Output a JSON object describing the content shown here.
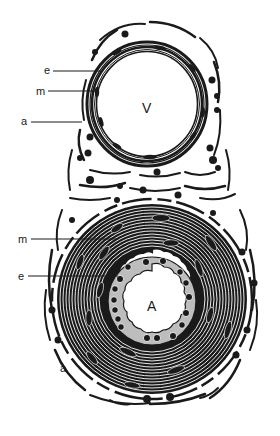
{
  "figure": {
    "vein": {
      "lumen_label": "V",
      "labels": [
        {
          "key": "e",
          "text": "e"
        },
        {
          "key": "m",
          "text": "m"
        },
        {
          "key": "a",
          "text": "a"
        }
      ]
    },
    "artery": {
      "lumen_label": "A",
      "labels": [
        {
          "key": "m",
          "text": "m"
        },
        {
          "key": "e",
          "text": "e"
        },
        {
          "key": "a",
          "text": "a"
        }
      ]
    },
    "colors": {
      "ink": "#1a1a1a",
      "intima_fill": "#bdbdbd",
      "background": "#ffffff"
    }
  }
}
